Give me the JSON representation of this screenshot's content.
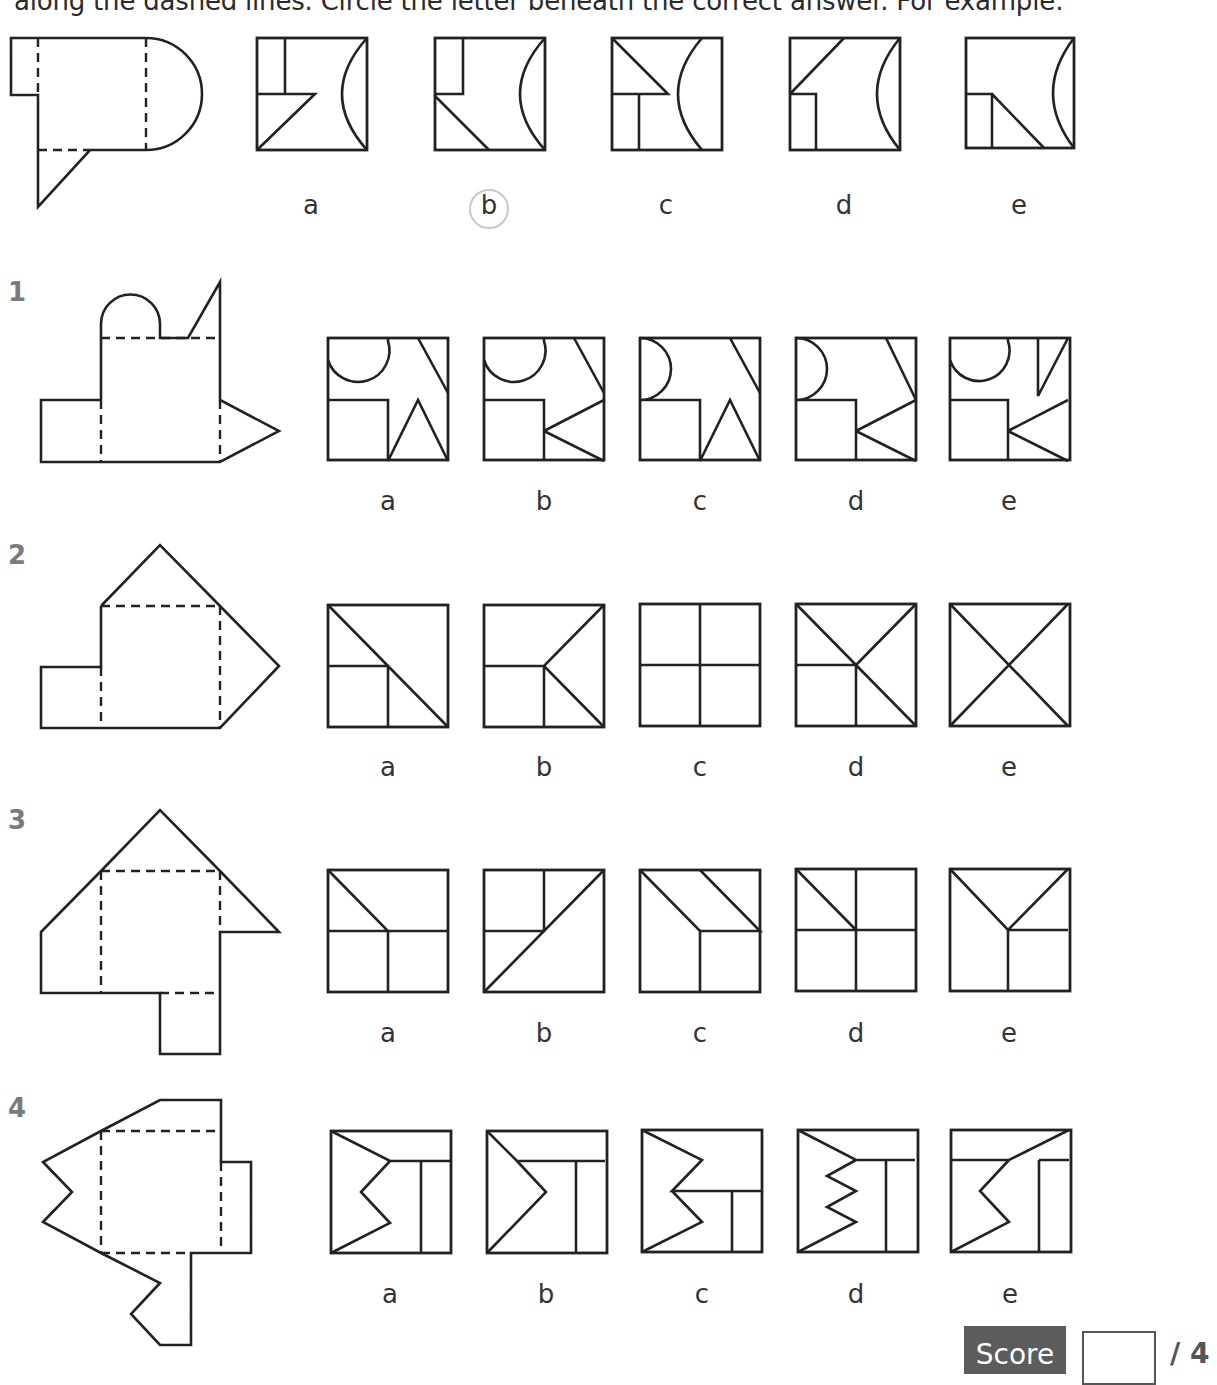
{
  "instructions": "along the dashed lines. Circle the letter beneath the correct answer. For example:",
  "colors": {
    "stroke": "#222222",
    "question_number": "#7a7a7a",
    "score_bg": "#5c5c5c",
    "circle": "#c8c8c8"
  },
  "example": {
    "selected": "b",
    "net": {
      "solid": "M38,150 L38,95 L11,95 L11,38 L146,38 A56,56 0 0 1 146,150 L90,150 L38,207 Z",
      "dashed": "M38,38 L38,95 M146,38 L146,150 M38,150 L90,150"
    },
    "options": [
      {
        "letter": "a",
        "x": 257,
        "y": 38,
        "w": 110,
        "h": 112,
        "paths": "M28,0 L28,56 L0,56 M0,56 L58,56 L0,112 M110,0 Q60,56 110,112"
      },
      {
        "letter": "b",
        "x": 435,
        "y": 38,
        "w": 110,
        "h": 112,
        "paths": "M28,0 L28,56 L0,56 M0,58 L54,112 M110,0 Q60,56 110,112"
      },
      {
        "letter": "c",
        "x": 612,
        "y": 38,
        "w": 110,
        "h": 112,
        "paths": "M0,0 L56,56 L0,56 M27,56 L27,112 M90,0 Q42,56 90,112"
      },
      {
        "letter": "d",
        "x": 790,
        "y": 38,
        "w": 110,
        "h": 112,
        "paths": "M0,56 L54,0 M0,56 L26,56 L26,112 M110,0 Q64,56 110,112"
      },
      {
        "letter": "e",
        "x": 966,
        "y": 38,
        "w": 108,
        "h": 110,
        "paths": "M0,56 L26,56 L26,110 M26,56 L78,110 M108,0 Q66,55 108,110"
      }
    ],
    "label_y": 190,
    "label_xs": [
      311,
      489,
      666,
      844,
      1019
    ]
  },
  "questions": [
    {
      "number": "1",
      "number_pos": [
        8,
        277
      ],
      "net": {
        "solid": "M101,400 L41,400 L41,462 L220,462 L279,431 L220,400 L220,282 L188,338 L160,338 L160,324 A29.5,29.5 0 0 0 101,324 L101,400",
        "dashed": "M101,338 L220,338 M101,400 L101,462 M220,400 L220,462"
      },
      "options": [
        {
          "letter": "a",
          "x": 328,
          "y": 338,
          "paths": "M60,0 L60,3 A30,30 0 0 1 0,22 M0,62 L60,62 L60,123 L90,62 L120,123 M90,0 L120,55"
        },
        {
          "letter": "b",
          "x": 484,
          "y": 338,
          "paths": "M60,0 L60,3 A30,30 0 0 1 0,22 M0,62 L60,62 L60,123 M60,93 L120,62 M60,93 L120,123 M90,0 L120,55"
        },
        {
          "letter": "c",
          "x": 640,
          "y": 338,
          "paths": "M0,0 A30,30 0 0 1 0,62 L60,62 L60,123 L90,62 L120,123 M90,0 L120,55"
        },
        {
          "letter": "d",
          "x": 796,
          "y": 338,
          "paths": "M0,0 A30,30 0 0 1 0,62 L60,62 L60,123 M60,93 L120,62 M60,93 L120,123 M90,0 L120,62"
        },
        {
          "letter": "e",
          "x": 950,
          "y": 338,
          "paths": "M58,0 L58,3 A29,29 0 0 1 0,22 M0,62 L58,62 L58,123 M58,93 L118,62 M58,93 L118,123 M88,0 L88,58 L118,0"
        }
      ],
      "label_y": 486,
      "label_xs": [
        388,
        544,
        700,
        856,
        1009
      ]
    },
    {
      "number": "2",
      "number_pos": [
        8,
        540
      ],
      "net": {
        "solid": "M101,606 L160,545 L220,606 L279,666 L220,728 L41,728 L41,667 L101,667 L101,606",
        "dashed": "M101,606 L220,606 M101,667 L101,728 M220,606 L220,728"
      },
      "options": [
        {
          "letter": "a",
          "x": 328,
          "y": 605,
          "paths": "M0,0 L120,122 M0,61 L60,61 L60,122"
        },
        {
          "letter": "b",
          "x": 484,
          "y": 605,
          "paths": "M0,61 L60,61 L120,0 M60,61 L120,122 M60,61 L60,122"
        },
        {
          "letter": "c",
          "x": 640,
          "y": 604,
          "paths": "M60,0 L60,122 M0,61 L120,61"
        },
        {
          "letter": "d",
          "x": 796,
          "y": 604,
          "paths": "M0,0 L120,122 M60,61 L120,0 M0,61 L60,61 L60,122"
        },
        {
          "letter": "e",
          "x": 950,
          "y": 604,
          "paths": "M0,0 L118,122 M118,0 L0,122"
        }
      ],
      "label_y": 752,
      "label_xs": [
        388,
        544,
        700,
        856,
        1009
      ]
    },
    {
      "number": "3",
      "number_pos": [
        8,
        805
      ],
      "net": {
        "solid": "M41,932 L101,871 L160,810 L220,871 L279,932 L220,932 L220,1054 L160,1054 L160,993 L41,993 Z",
        "dashed": "M101,871 L220,871 M101,871 L101,993 M220,871 L220,932 M160,993 L220,993"
      },
      "options": [
        {
          "letter": "a",
          "x": 328,
          "y": 870,
          "paths": "M0,0 L60,61 L60,122 M0,61 L120,61"
        },
        {
          "letter": "b",
          "x": 484,
          "y": 870,
          "paths": "M60,0 L60,61 L0,61 M0,122 L120,0"
        },
        {
          "letter": "c",
          "x": 640,
          "y": 870,
          "paths": "M0,0 L60,61 L120,61 L60,0 M60,61 L60,122"
        },
        {
          "letter": "d",
          "x": 796,
          "y": 869,
          "paths": "M0,0 L60,61 M60,0 L60,122 M0,61 L120,61"
        },
        {
          "letter": "e",
          "x": 950,
          "y": 869,
          "paths": "M0,0 L58,61 L118,0 M58,61 L58,122 M58,61 L118,61"
        }
      ],
      "label_y": 1018,
      "label_xs": [
        388,
        544,
        700,
        856,
        1009
      ]
    },
    {
      "number": "4",
      "number_pos": [
        8,
        1093
      ],
      "net": {
        "solid": "M101,1131 L160,1100 L221,1100 L221,1162 L251,1162 L251,1253 L191,1253 L191,1345 L160,1345 L131,1314 L160,1283 L101,1253 L43,1222 L72,1192 L43,1162 Z",
        "dashed": "M101,1131 L221,1131 M101,1131 L101,1253 M221,1162 L221,1253 M101,1253 L191,1253"
      },
      "options": [
        {
          "letter": "a",
          "x": 331,
          "y": 1131,
          "paths": "M0,0 L59,30 L120,30 M59,30 L30,61 L59,92 L0,122 M90,30 L90,122"
        },
        {
          "letter": "b",
          "x": 487,
          "y": 1131,
          "paths": "M0,0 L30,30 L118,30 M30,30 L59,61 L0,122 M89,30 L89,122"
        },
        {
          "letter": "c",
          "x": 642,
          "y": 1130,
          "paths": "M0,0 L60,30 L30,61 L120,61 M30,61 L60,92 L0,122 M90,61 L90,122"
        },
        {
          "letter": "d",
          "x": 798,
          "y": 1130,
          "paths": "M0,0 L58,30 L117,30 M58,30 L29,46 L58,61 L29,77 L58,92 L0,122 M88,30 L88,122"
        },
        {
          "letter": "e",
          "x": 951,
          "y": 1130,
          "paths": "M118,0 L58,30 L0,30 M58,30 L29,61 L58,92 L0,122 M88,30 L118,30 M88,30 L88,122"
        }
      ],
      "label_y": 1279,
      "label_xs": [
        390,
        546,
        702,
        856,
        1010
      ]
    }
  ],
  "score": {
    "label": "Score",
    "value": "",
    "max": "/ 4"
  }
}
